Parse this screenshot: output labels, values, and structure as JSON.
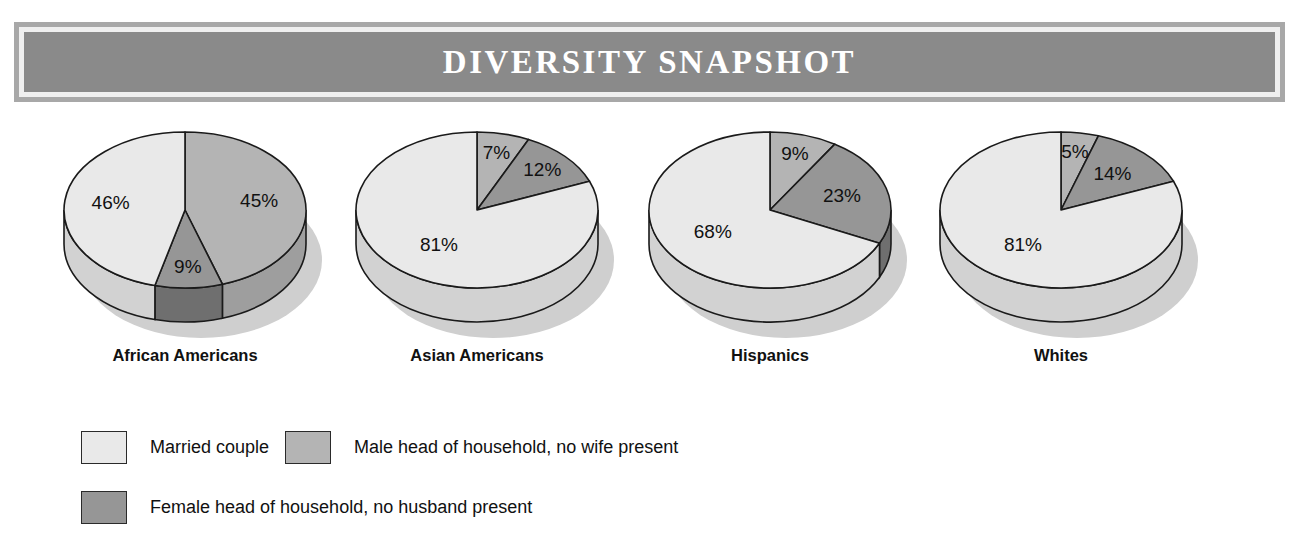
{
  "banner": {
    "title": "DIVERSITY SNAPSHOT"
  },
  "colors": {
    "married": "#e9e9e9",
    "male_head": "#b4b4b4",
    "female_head": "#969696",
    "married_side": "#d2d2d2",
    "male_head_side": "#9e9e9e",
    "female_head_side": "#6f6f6f",
    "outline": "#1a1a1a",
    "shadow": "#cfcfcf",
    "banner_fill": "#8a8a8a",
    "banner_border": "#a8a8a8",
    "banner_gap": "#efefef",
    "title_text": "#ffffff"
  },
  "legend": {
    "items": [
      {
        "label": "Married couple",
        "key": "married"
      },
      {
        "label": "Male head of household, no wife present",
        "key": "male_head"
      },
      {
        "label": "Female head of household, no husband present",
        "key": "female_head"
      }
    ]
  },
  "chart_data": {
    "type": "pie",
    "title": "DIVERSITY SNAPSHOT",
    "subtitle": "",
    "xlabel": "",
    "ylabel": "",
    "units": "percent",
    "legend_position": "bottom-left",
    "grid": false,
    "series_names": [
      "Married couple",
      "Male head of household, no wife present",
      "Female head of household, no husband present"
    ],
    "charts": [
      {
        "name": "African Americans",
        "labels": [
          "Married couple",
          "Male head of household, no wife present",
          "Female head of household, no husband present"
        ],
        "values": [
          46,
          45,
          9
        ],
        "value_labels": [
          "46%",
          "45%",
          "9%"
        ]
      },
      {
        "name": "Asian Americans",
        "labels": [
          "Married couple",
          "Male head of household, no wife present",
          "Female head of household, no husband present"
        ],
        "values": [
          81,
          7,
          12
        ],
        "value_labels": [
          "81%",
          "7%",
          "12%"
        ]
      },
      {
        "name": "Hispanics",
        "labels": [
          "Married couple",
          "Male head of household, no wife present",
          "Female head of household, no husband present"
        ],
        "values": [
          68,
          9,
          23
        ],
        "value_labels": [
          "68%",
          "9%",
          "23%"
        ]
      },
      {
        "name": "Whites",
        "labels": [
          "Married couple",
          "Male head of household, no wife present",
          "Female head of household, no husband present"
        ],
        "values": [
          81,
          5,
          14
        ],
        "value_labels": [
          "81%",
          "5%",
          "14%"
        ]
      }
    ]
  },
  "layout": {
    "pie_centers_x": [
      185,
      477,
      770,
      1061
    ],
    "pie_radius_x": 121,
    "pie_radius_y": 78,
    "pie_depth": 34,
    "pie_center_y": 92
  }
}
